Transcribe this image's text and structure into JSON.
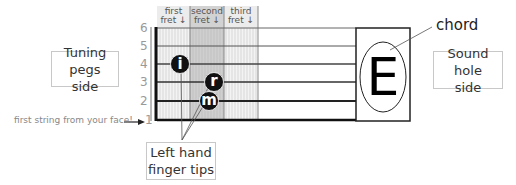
{
  "fret_headers": [
    {
      "line1": "first",
      "line2": "fret ↓"
    },
    {
      "line1": "second",
      "line2": "fret ↓"
    },
    {
      "line1": "third",
      "line2": "fret ↓"
    }
  ],
  "string_numbers": [
    "6",
    "5",
    "4",
    "3",
    "2",
    "1"
  ],
  "fingers": [
    {
      "letter": "i",
      "string": 4,
      "fret": 1
    },
    {
      "letter": "r",
      "string": 3,
      "fret": 2
    },
    {
      "letter": "m",
      "string": 2,
      "fret": 2
    }
  ],
  "chord": {
    "name": "E",
    "label": "chord"
  },
  "labels": {
    "tuning_pegs_line1": "Tuning pegs",
    "tuning_pegs_line2": "side",
    "sound_hole_line1": "Sound hole",
    "sound_hole_line2": "side",
    "finger_tips_line1": "Left hand",
    "finger_tips_line2": "finger tips",
    "first_string": "first string from your face!"
  },
  "colors": {
    "highlight_fret": "#c8c8c8",
    "fret_header_bg": "#e6e6e6",
    "string_color": "#222222",
    "grid_texture": "#d4d4d4"
  }
}
